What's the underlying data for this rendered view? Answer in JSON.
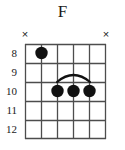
{
  "chord": {
    "title": "F",
    "instrument": "guitar",
    "string_count": 6,
    "fret_count": 5,
    "start_fret": 8,
    "fret_numbers": [
      "8",
      "9",
      "10",
      "11",
      "12"
    ],
    "string_markers": [
      "x",
      "",
      "",
      "",
      "",
      "x"
    ],
    "mute_symbol": "×",
    "dots": [
      {
        "string": 2,
        "fret": 8
      },
      {
        "string": 3,
        "fret": 10
      },
      {
        "string": 4,
        "fret": 10
      },
      {
        "string": 5,
        "fret": 10
      }
    ],
    "barre": {
      "fret": 10,
      "from_string": 3,
      "to_string": 5
    },
    "colors": {
      "ink": "#1a1a1a",
      "grid": "#4d4d4d",
      "dot": "#111111",
      "background": "#ffffff"
    }
  }
}
